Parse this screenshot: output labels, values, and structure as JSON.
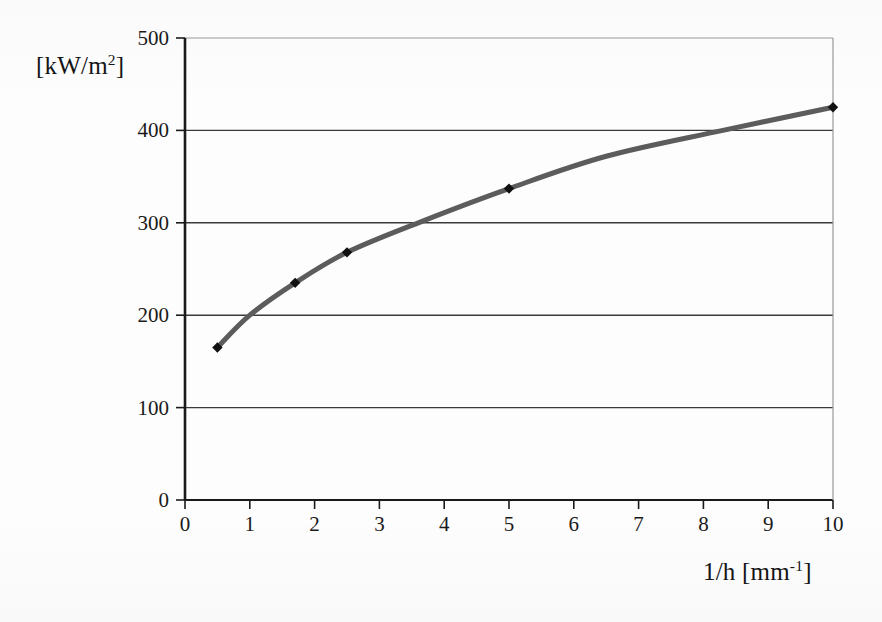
{
  "chart_data": {
    "type": "line",
    "title": "",
    "subtitle": "",
    "xlabel": "1/h [mm-1]",
    "xlabel_base": "1/h [mm",
    "xlabel_exp": "-1",
    "xlabel_close": "]",
    "ylabel": "[kW/m2]",
    "ylabel_base": "[kW/m",
    "ylabel_exp": "2",
    "ylabel_close": "]",
    "xlim": [
      0,
      10
    ],
    "ylim": [
      0,
      500
    ],
    "xticks": [
      "0",
      "1",
      "2",
      "3",
      "4",
      "5",
      "6",
      "7",
      "8",
      "9",
      "10"
    ],
    "xtick_values": [
      0,
      1,
      2,
      3,
      4,
      5,
      6,
      7,
      8,
      9,
      10
    ],
    "yticks": [
      "0",
      "100",
      "200",
      "300",
      "400",
      "500"
    ],
    "ytick_values": [
      0,
      100,
      200,
      300,
      400,
      500
    ],
    "grid": "horizontal",
    "gridlines_y": [
      100,
      200,
      300,
      400,
      500
    ],
    "legend": "none",
    "series": [
      {
        "name": "heat flux",
        "marker": "diamond",
        "marker_color": "#111111",
        "line_color": "#5c5c5c",
        "line_width": 5,
        "x": [
          0.5,
          1.7,
          2.5,
          5.0,
          10.0
        ],
        "values": [
          165,
          235,
          268,
          337,
          425
        ],
        "curve_x": [
          0.5,
          1.0,
          1.7,
          2.5,
          3.6,
          5.0,
          6.5,
          8.3,
          10.0
        ],
        "curve_y": [
          165,
          200,
          235,
          268,
          300,
          337,
          372,
          400,
          425
        ]
      }
    ],
    "colors": {
      "axis": "#1a1a1a",
      "grid": "#3a3a3a",
      "grid_faint": "#9a9a9a",
      "background": "#fdfdfd",
      "line": "#5c5c5c",
      "marker": "#111111"
    }
  }
}
